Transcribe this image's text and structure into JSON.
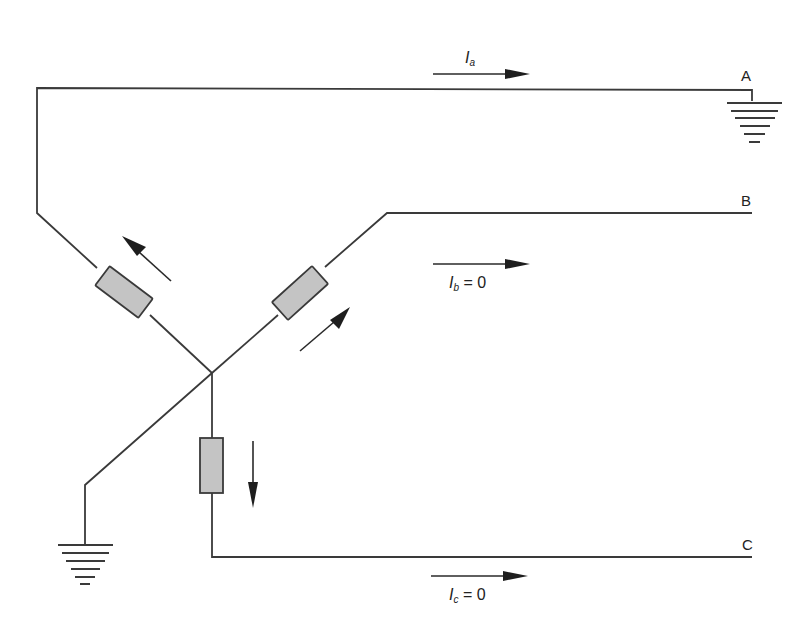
{
  "diagram": {
    "type": "circuit-schematic",
    "phases": [
      {
        "id": "A",
        "label": "A",
        "current_symbol": "I",
        "current_sub": "a",
        "current_value": "",
        "terminal": "grounded"
      },
      {
        "id": "B",
        "label": "B",
        "current_symbol": "I",
        "current_sub": "b",
        "current_value": "= 0",
        "terminal": "open"
      },
      {
        "id": "C",
        "label": "C",
        "current_symbol": "I",
        "current_sub": "c",
        "current_value": "= 0",
        "terminal": "open"
      }
    ],
    "neutral": {
      "grounded": true
    },
    "colors": {
      "wire": "#3a3a3a",
      "impedance_fill": "#c4c4c4",
      "arrow": "#1e1e1e",
      "background": "#ffffff"
    }
  }
}
